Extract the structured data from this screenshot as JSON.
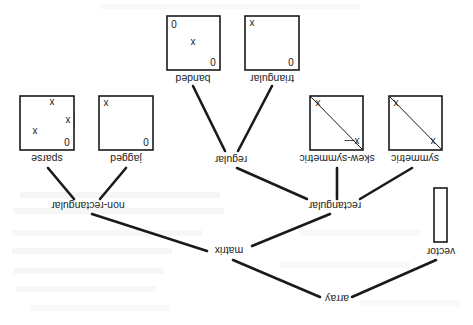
{
  "diagram": {
    "orientation_degrees": 180,
    "nodes": {
      "array": "array",
      "vector": "vector",
      "matrix": "matrix",
      "rectangular": "rectangular",
      "non_rectangular": "non-rectangular",
      "regular": "regular",
      "symmetric": "symmetric",
      "skew_symmetric": "skew-symmetric",
      "jagged": "jagged",
      "sparse": "sparse",
      "banded": "banded",
      "triangular": "triangular"
    },
    "edges": [
      [
        "array",
        "vector"
      ],
      [
        "array",
        "matrix"
      ],
      [
        "matrix",
        "rectangular"
      ],
      [
        "matrix",
        "non-rectangular"
      ],
      [
        "rectangular",
        "symmetric"
      ],
      [
        "rectangular",
        "skew-symmetric"
      ],
      [
        "rectangular",
        "regular"
      ],
      [
        "regular",
        "triangular"
      ],
      [
        "regular",
        "banded"
      ],
      [
        "non-rectangular",
        "jagged"
      ],
      [
        "non-rectangular",
        "sparse"
      ]
    ],
    "glyphs": {
      "x": "x",
      "neg_x": "x—",
      "zero": "0"
    },
    "colors": {
      "ink": "#1a1a1a",
      "paper": "#ffffff",
      "stipple": "#8a8a8a"
    }
  }
}
